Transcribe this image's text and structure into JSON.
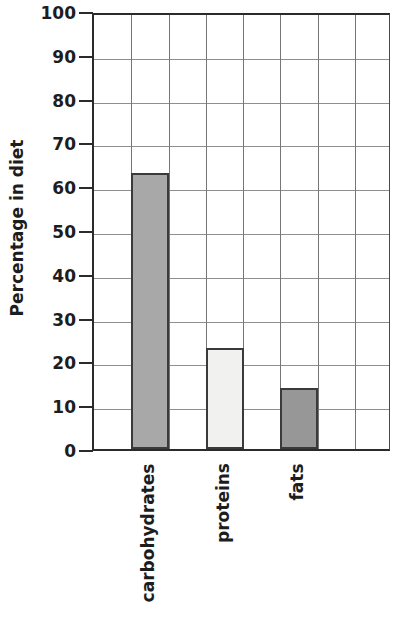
{
  "chart_data": {
    "type": "bar",
    "title": "",
    "subtitle": "",
    "xlabel": "",
    "ylabel": "Percentage in diet",
    "categories": [
      "carbohydrates",
      "proteins",
      "fats"
    ],
    "values": [
      63,
      23,
      14
    ],
    "series": [
      {
        "name": "Percentage in diet",
        "values": [
          63,
          23,
          14
        ]
      }
    ],
    "ylim": [
      0,
      100
    ],
    "ytick_step": 10,
    "ytick_labels": [
      "100",
      "90",
      "80",
      "70",
      "60",
      "50",
      "40",
      "30",
      "20",
      "10",
      "0"
    ],
    "ytick_values": [
      100,
      90,
      80,
      70,
      60,
      50,
      40,
      30,
      20,
      10,
      0
    ],
    "grid": {
      "horizontal": true,
      "vertical": true,
      "vertical_columns": 8
    },
    "legend": {
      "visible": false,
      "position": "none",
      "entries": []
    },
    "annotations": [],
    "bar_styles": [
      {
        "category": "carbohydrates",
        "fill": "#a8a8a8",
        "stroke": "#3a3a3a",
        "column": 2
      },
      {
        "category": "proteins",
        "fill": "#f1f1ef",
        "stroke": "#3a3a3a",
        "column": 4
      },
      {
        "category": "fats",
        "fill": "#979797",
        "stroke": "#3a3a3a",
        "column": 6
      }
    ],
    "axis_color": "#2b2b2b",
    "grid_color": "#8e8e8e",
    "background": "#ffffff",
    "x_label_rotation": -90
  }
}
